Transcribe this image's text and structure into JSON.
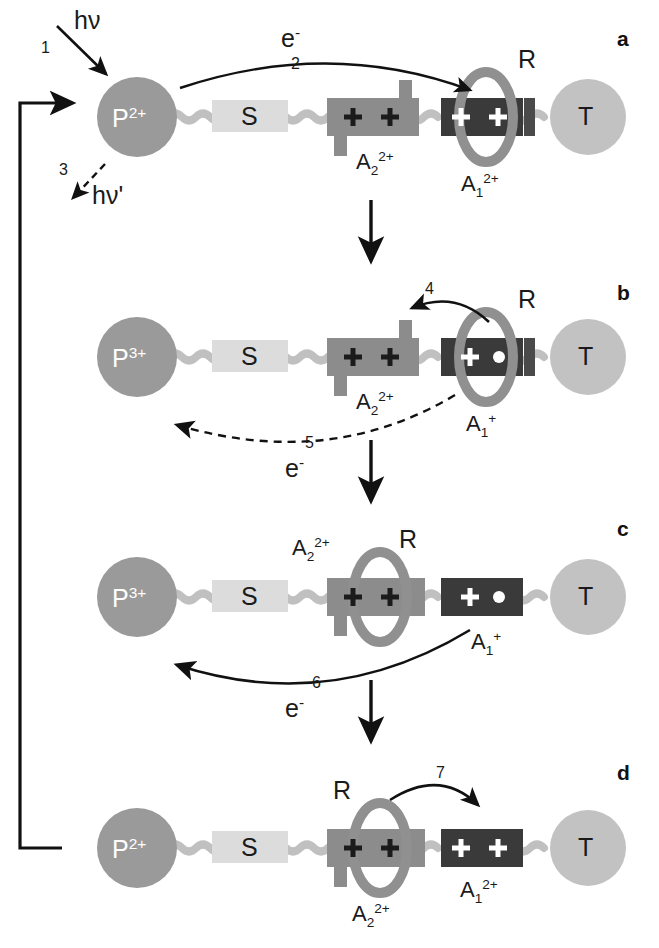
{
  "figure": {
    "type": "molecular-shuttle-mechanism-diagram",
    "panels": [
      "a",
      "b",
      "c",
      "d"
    ],
    "background_color": "#ffffff"
  },
  "colors": {
    "photosensitizer_P": "#9a9a9a",
    "spacer_S": "#dcdcdc",
    "station_A2": "#8c8c8c",
    "station_A1": "#3a3a3a",
    "ring_R": "#909090",
    "terminal_T": "#c2c2c2",
    "chain": "#c0c0c0",
    "stopper": "#4a4a4a",
    "arrow": "#111111",
    "plus_dark": "#1b1b1b",
    "plus_light": "#ffffff"
  },
  "components": {
    "P": "P",
    "S": "S",
    "T": "T",
    "R": "R",
    "A1": "A",
    "A2": "A",
    "sub_1": "1",
    "sub_2": "2",
    "charge_2plus": "2+",
    "charge_3plus": "3+",
    "charge_plus": "+",
    "plus_sign": "+",
    "radical_dot": "•",
    "electron": "e",
    "electron_charge": "-",
    "photon_absorb": "hν",
    "photon_emit": "hν'"
  },
  "panel_a": {
    "letter": "a",
    "P_label": "P",
    "P_charge": "2+",
    "S_label": "S",
    "T_label": "T",
    "R_label": "R",
    "A2_label": "A",
    "A2_sub": "2",
    "A2_charge": "2+",
    "A1_label": "A",
    "A1_sub": "1",
    "A1_charge": "2+",
    "step1_num": "1",
    "step1_label": "hν",
    "step2_num": "2",
    "step2_label": "e",
    "step2_label_sup": "-",
    "step3_num": "3",
    "step3_label": "hν'",
    "A2_plus_left": "+",
    "A2_plus_right": "+",
    "A1_plus_left": "+",
    "A1_plus_right": "+"
  },
  "panel_b": {
    "letter": "b",
    "P_label": "P",
    "P_charge": "3+",
    "S_label": "S",
    "T_label": "T",
    "R_label": "R",
    "A2_label": "A",
    "A2_sub": "2",
    "A2_charge": "2+",
    "A1_label": "A",
    "A1_sub": "1",
    "A1_charge": "+",
    "step4_num": "4",
    "step5_num": "5",
    "step5_label": "e",
    "step5_label_sup": "-",
    "A2_plus_left": "+",
    "A2_plus_right": "+",
    "A1_plus": "+",
    "A1_dot": "•"
  },
  "panel_c": {
    "letter": "c",
    "P_label": "P",
    "P_charge": "3+",
    "S_label": "S",
    "T_label": "T",
    "R_label": "R",
    "A2_label": "A",
    "A2_sub": "2",
    "A2_charge": "2+",
    "A1_label": "A",
    "A1_sub": "1",
    "A1_charge": "+",
    "step6_num": "6",
    "step6_label": "e",
    "step6_label_sup": "-",
    "A2_plus_left": "+",
    "A2_plus_right": "+",
    "A1_plus": "+",
    "A1_dot": "•"
  },
  "panel_d": {
    "letter": "d",
    "P_label": "P",
    "P_charge": "2+",
    "S_label": "S",
    "T_label": "T",
    "R_label": "R",
    "A2_label": "A",
    "A2_sub": "2",
    "A2_charge": "2+",
    "A1_label": "A",
    "A1_sub": "1",
    "A1_charge": "2+",
    "step7_num": "7",
    "A2_plus_left": "+",
    "A2_plus_right": "+",
    "A1_plus_left": "+",
    "A1_plus_right": "+"
  }
}
